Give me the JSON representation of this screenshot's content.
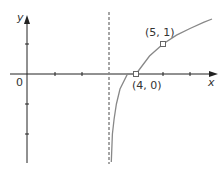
{
  "diagram": {
    "type": "function-graph",
    "function": "y = log2(x - 3)",
    "axes": {
      "x_label": "x",
      "y_label": "y",
      "origin_label": "0"
    },
    "asymptote": {
      "x": 3,
      "style": "dashed"
    },
    "points": [
      {
        "label": "(4, 0)",
        "x": 4,
        "y": 0
      },
      {
        "label": "(5, 1)",
        "x": 5,
        "y": 1
      }
    ],
    "colors": {
      "axis": "#222222",
      "curve": "#888888",
      "asymptote": "#888888",
      "text": "#333333"
    }
  }
}
